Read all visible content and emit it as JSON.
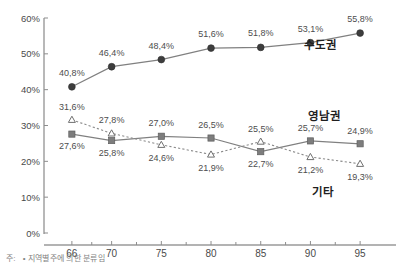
{
  "chart_data": {
    "type": "line",
    "title": "",
    "xlabel": "",
    "ylabel": "",
    "x": [
      66,
      70,
      75,
      80,
      85,
      90,
      95
    ],
    "categories": [
      "66",
      "70",
      "75",
      "80",
      "85",
      "90",
      "95"
    ],
    "xlim": [
      64,
      97
    ],
    "ylim": [
      0,
      60
    ],
    "yticks": [
      0,
      10,
      20,
      30,
      40,
      50,
      60
    ],
    "ytick_labels": [
      "0%",
      "10%",
      "20%",
      "30%",
      "40%",
      "50%",
      "60%"
    ],
    "grid": false,
    "legend_position": "inline-right",
    "value_format": "decimal-comma-percent",
    "series": [
      {
        "name": "수도권",
        "marker": "filled-circle",
        "line": "solid",
        "color": "#3d3d3d",
        "values": [
          40.8,
          46.4,
          48.4,
          51.6,
          51.8,
          53.1,
          55.8
        ],
        "labels": [
          "40,8%",
          "46,4%",
          "48,4%",
          "51,6%",
          "51,8%",
          "53,1%",
          "55,8%"
        ]
      },
      {
        "name": "영남권",
        "marker": "filled-square",
        "line": "solid",
        "color": "#7d7d7d",
        "values": [
          27.6,
          25.8,
          27.0,
          26.5,
          22.7,
          25.7,
          24.9
        ],
        "labels": [
          "27,6%",
          "25,8%",
          "27,0%",
          "26,5%",
          "22,7%",
          "25,7%",
          "24,9%"
        ]
      },
      {
        "name": "기타",
        "marker": "open-triangle",
        "line": "dotted",
        "color": "#6f6f6f",
        "values": [
          31.6,
          27.8,
          24.6,
          21.9,
          25.5,
          21.2,
          19.3
        ],
        "labels": [
          "31,6%",
          "27,8%",
          "24,6%",
          "21,9%",
          "25,5%",
          "21,2%",
          "19,3%"
        ]
      }
    ],
    "series_annotations": [
      {
        "text": "수도권",
        "x": 320,
        "y": 49
      },
      {
        "text": "영남권",
        "x": 324,
        "y": 120
      },
      {
        "text": "기타",
        "x": 323,
        "y": 196
      }
    ]
  },
  "footnote": {
    "key": "주:",
    "text": "• 지역별주에 의한 분류임"
  }
}
